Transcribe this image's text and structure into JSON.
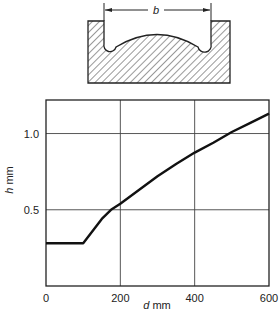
{
  "diagram": {
    "dimension_label": "b"
  },
  "chart_data": {
    "type": "line",
    "title": "",
    "xlabel_var": "d",
    "xlabel_unit": "mm",
    "ylabel_var": "h",
    "ylabel_unit": "mm",
    "xlim": [
      0,
      600
    ],
    "ylim": [
      0,
      1.22
    ],
    "xticks": [
      0,
      200,
      400,
      600
    ],
    "xtick_labels": [
      "0",
      "200",
      "400",
      "600"
    ],
    "yticks": [
      0.5,
      1.0
    ],
    "ytick_labels": [
      "0.5",
      "1.0"
    ],
    "grid": true,
    "series": [
      {
        "name": "h vs d",
        "x": [
          0,
          100,
          150,
          175,
          200,
          250,
          300,
          350,
          400,
          450,
          500,
          550,
          600
        ],
        "y": [
          0.28,
          0.28,
          0.44,
          0.5,
          0.54,
          0.63,
          0.72,
          0.8,
          0.875,
          0.94,
          1.01,
          1.07,
          1.13
        ]
      }
    ]
  }
}
